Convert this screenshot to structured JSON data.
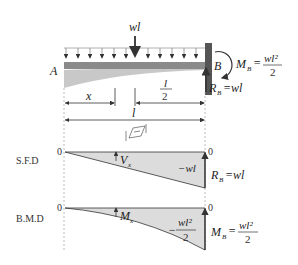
{
  "beam": {
    "load_label": "wl",
    "left_end": "A",
    "right_end": "B",
    "moment_label": "M",
    "moment_sub": "B",
    "moment_num": "wl²",
    "moment_den": "2",
    "reaction_label": "R",
    "reaction_sub": "B",
    "reaction_value": "=wl",
    "dim_x": "x",
    "dim_half_num": "l",
    "dim_half_den": "2",
    "dim_total": "l"
  },
  "sfd": {
    "label": "S.F.D",
    "zero_left": "0",
    "zero_right": "0",
    "section_label": "V",
    "section_sub": "x",
    "end_value": "−wl",
    "reaction_label": "R",
    "reaction_sub": "B",
    "reaction_value": "=wl"
  },
  "bmd": {
    "label": "B.M.D",
    "zero_left": "0",
    "zero_right": "0",
    "section_label": "M",
    "section_sub": "x",
    "end_value_prefix": "−",
    "end_num": "wl²",
    "end_den": "2",
    "moment_label": "M",
    "moment_sub": "B",
    "moment_num": "wl²",
    "moment_den": "2"
  },
  "colors": {
    "beam": "#8a8a8a",
    "deflection": "#c8c8c8",
    "fill": "#dcdcdc",
    "wall": "#555555",
    "line": "#333333"
  }
}
